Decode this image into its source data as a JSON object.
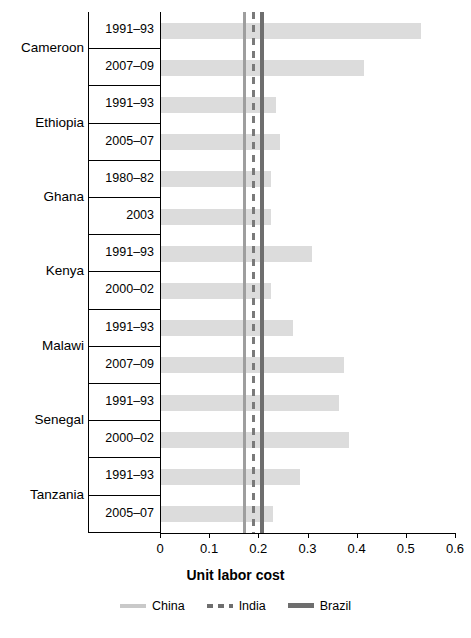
{
  "chart_data": {
    "type": "bar",
    "orientation": "horizontal",
    "title": "",
    "xlabel": "Unit labor cost",
    "ylabel": "",
    "xlim": [
      0,
      0.6
    ],
    "xticks": [
      "0",
      "0.1",
      "0.2",
      "0.3",
      "0.4",
      "0.5",
      "0.6"
    ],
    "xtick_values": [
      0,
      0.1,
      0.2,
      0.3,
      0.4,
      0.5,
      0.6
    ],
    "grid": false,
    "legend_position": "bottom",
    "countries": [
      {
        "name": "Cameroon",
        "rows": [
          {
            "period": "1991–93",
            "value": 0.53
          },
          {
            "period": "2007–09",
            "value": 0.415
          }
        ]
      },
      {
        "name": "Ethiopia",
        "rows": [
          {
            "period": "1991–93",
            "value": 0.235
          },
          {
            "period": "2005–07",
            "value": 0.245
          }
        ]
      },
      {
        "name": "Ghana",
        "rows": [
          {
            "period": "1980–82",
            "value": 0.225
          },
          {
            "period": "2003",
            "value": 0.225
          }
        ]
      },
      {
        "name": "Kenya",
        "rows": [
          {
            "period": "1991–93",
            "value": 0.31
          },
          {
            "period": "2000–02",
            "value": 0.225
          }
        ]
      },
      {
        "name": "Malawi",
        "rows": [
          {
            "period": "1991–93",
            "value": 0.27
          },
          {
            "period": "2007–09",
            "value": 0.375
          }
        ]
      },
      {
        "name": "Senegal",
        "rows": [
          {
            "period": "1991–93",
            "value": 0.365
          },
          {
            "period": "2000–02",
            "value": 0.385
          }
        ]
      },
      {
        "name": "Tanzania",
        "rows": [
          {
            "period": "1991–93",
            "value": 0.285
          },
          {
            "period": "2005–07",
            "value": 0.23
          }
        ]
      }
    ],
    "reference_lines": [
      {
        "name": "China",
        "value": 0.172,
        "color": "#9e9e9e",
        "style": "solid"
      },
      {
        "name": "India",
        "value": 0.19,
        "color": "#7a7a7a",
        "style": "dashed"
      },
      {
        "name": "Brazil",
        "value": 0.208,
        "color": "#6e6e6e",
        "style": "solid"
      }
    ],
    "series_color": "#dcdcdc"
  },
  "legend": {
    "items": [
      {
        "label": "China"
      },
      {
        "label": "India"
      },
      {
        "label": "Brazil"
      }
    ]
  }
}
